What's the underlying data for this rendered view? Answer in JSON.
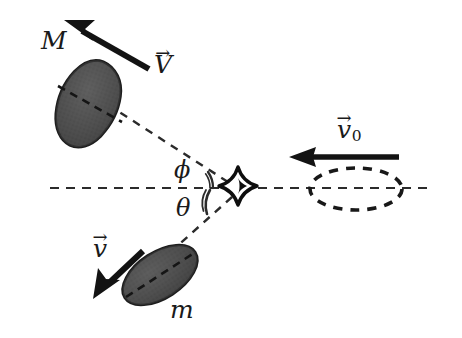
{
  "figure": {
    "background_color": "#ffffff",
    "stroke_color": "#1a1a1a",
    "body_fill_color": "#4a4a4a",
    "width": 462,
    "height": 338
  },
  "labels": {
    "mass_M": "M",
    "velocity_V": "V",
    "velocity_v0": "v",
    "velocity_v0_subscript": "0",
    "angle_phi": "ϕ",
    "angle_theta": "θ",
    "velocity_v": "v",
    "mass_m": "m",
    "vector_accent": "→"
  },
  "elements": {
    "collision_point": {
      "name": "collision-burst",
      "x": 238,
      "y": 188
    },
    "axis_line": {
      "name": "horizontal-axis-dashed",
      "x1": 50,
      "y1": 188,
      "x2": 432,
      "y2": 188,
      "style": "dashed"
    },
    "incoming_body": {
      "name": "incoming-projectile-outline",
      "cx": 356,
      "cy": 189,
      "rx": 46,
      "ry": 21,
      "style": "dashed-outline"
    },
    "mass_M_body": {
      "name": "mass-M-blob",
      "cx": 88,
      "cy": 104,
      "rx": 28,
      "ry": 44,
      "rotation_deg": 22
    },
    "mass_m_body": {
      "name": "mass-m-blob",
      "cx": 160,
      "cy": 275,
      "rx": 41,
      "ry": 23,
      "rotation_deg": -32
    },
    "vector_V_arrow": {
      "name": "velocity-V-arrow",
      "x1": 148,
      "y1": 68,
      "x2": 66,
      "y2": 21
    },
    "vector_v0_arrow": {
      "name": "velocity-v0-arrow",
      "x1": 399,
      "y1": 157,
      "x2": 291,
      "y2": 157
    },
    "vector_v_arrow": {
      "name": "velocity-v-arrow",
      "x1": 142,
      "y1": 252,
      "x2": 95,
      "y2": 297
    },
    "trajectory_M": {
      "name": "trajectory-dashed-to-M",
      "x1": 230,
      "y1": 183,
      "x2": 112,
      "y2": 108
    },
    "trajectory_m": {
      "name": "trajectory-dashed-to-m",
      "x1": 233,
      "y1": 196,
      "x2": 148,
      "y2": 272
    }
  },
  "geometry": {
    "phi_angle_deg": 33,
    "theta_angle_deg": 41,
    "description": "Incoming mass travels leftward along the horizontal axis with velocity v0, collides, and scatters into mass M at angle phi above the axis with velocity V and mass m at angle theta below the axis with velocity v."
  }
}
